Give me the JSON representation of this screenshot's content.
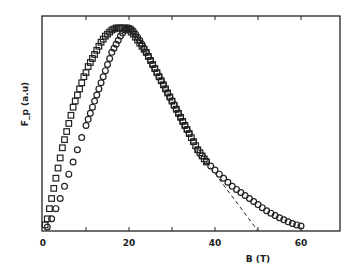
{
  "chart_data": {
    "type": "scatter",
    "title": "",
    "xlabel": "B (T)",
    "ylabel": "F_p (a.u)",
    "xlim": [
      0,
      69
    ],
    "ylim": [
      0,
      1.06
    ],
    "x_ticks": [
      0,
      10,
      20,
      30,
      40,
      50,
      60
    ],
    "x_tick_labels": [
      "0",
      "",
      "20",
      "",
      "40",
      "",
      "60"
    ],
    "y_ticks": [],
    "grid": false,
    "legend": null,
    "series": [
      {
        "name": "squares",
        "marker": "square",
        "x": [
          0.5,
          1,
          1.5,
          2,
          2.5,
          3,
          3.5,
          4,
          4.5,
          5,
          5.5,
          6,
          6.5,
          7,
          7.5,
          8,
          8.5,
          9,
          9.5,
          10,
          10.5,
          11,
          11.5,
          12,
          12.5,
          13,
          13.5,
          14,
          14.5,
          15,
          15.5,
          16,
          16.5,
          17,
          17.5,
          18,
          18.5,
          19,
          19.5,
          20,
          20.5,
          21,
          21.5,
          22,
          22.5,
          23,
          23.5,
          24,
          24.5,
          25,
          25.5,
          26,
          26.5,
          27,
          27.5,
          28,
          28.5,
          29,
          29.5,
          30,
          30.5,
          31,
          31.5,
          32,
          32.5,
          33,
          33.5,
          34,
          34.5,
          35,
          35.5,
          36,
          36.5,
          37,
          37.5,
          38
        ],
        "y": [
          0.03,
          0.06,
          0.11,
          0.16,
          0.21,
          0.26,
          0.31,
          0.36,
          0.41,
          0.45,
          0.49,
          0.53,
          0.57,
          0.61,
          0.64,
          0.67,
          0.7,
          0.73,
          0.76,
          0.78,
          0.81,
          0.83,
          0.85,
          0.87,
          0.89,
          0.91,
          0.93,
          0.945,
          0.96,
          0.97,
          0.98,
          0.99,
          0.995,
          1.0,
          1.0,
          1.0,
          1.0,
          1.0,
          0.995,
          0.99,
          0.98,
          0.97,
          0.955,
          0.94,
          0.925,
          0.91,
          0.895,
          0.88,
          0.86,
          0.84,
          0.82,
          0.8,
          0.78,
          0.76,
          0.74,
          0.72,
          0.7,
          0.68,
          0.66,
          0.64,
          0.62,
          0.6,
          0.58,
          0.56,
          0.54,
          0.52,
          0.5,
          0.48,
          0.46,
          0.44,
          0.42,
          0.4,
          0.385,
          0.37,
          0.355,
          0.34
        ]
      },
      {
        "name": "circles",
        "marker": "circle",
        "x": [
          1,
          2,
          3,
          4,
          5,
          6,
          7,
          8,
          9,
          10,
          10.5,
          11,
          11.5,
          12,
          12.5,
          13,
          13.5,
          14,
          14.5,
          15,
          15.5,
          16,
          16.5,
          17,
          17.5,
          18,
          18.5,
          19,
          19.5,
          20,
          20.5,
          21,
          21.5,
          22,
          22.5,
          23,
          23.5,
          24,
          24.5,
          25,
          25.5,
          26,
          26.5,
          27,
          27.5,
          28,
          28.5,
          29,
          29.5,
          30,
          30.5,
          31,
          31.5,
          32,
          32.5,
          33,
          33.5,
          34,
          35,
          36,
          37,
          38,
          39,
          40,
          41,
          42,
          43,
          44,
          45,
          46,
          47,
          48,
          49,
          50,
          51,
          52,
          53,
          54,
          55,
          56,
          57,
          58,
          59,
          60
        ],
        "y": [
          0.02,
          0.06,
          0.11,
          0.16,
          0.22,
          0.28,
          0.34,
          0.4,
          0.46,
          0.52,
          0.55,
          0.58,
          0.61,
          0.64,
          0.67,
          0.7,
          0.73,
          0.76,
          0.79,
          0.82,
          0.85,
          0.88,
          0.9,
          0.92,
          0.94,
          0.96,
          0.975,
          0.99,
          1.0,
          1.0,
          0.995,
          0.985,
          0.97,
          0.955,
          0.94,
          0.92,
          0.9,
          0.88,
          0.86,
          0.84,
          0.82,
          0.8,
          0.78,
          0.76,
          0.74,
          0.72,
          0.7,
          0.68,
          0.66,
          0.64,
          0.62,
          0.6,
          0.58,
          0.56,
          0.54,
          0.52,
          0.5,
          0.48,
          0.44,
          0.4,
          0.37,
          0.345,
          0.32,
          0.3,
          0.28,
          0.26,
          0.24,
          0.22,
          0.205,
          0.19,
          0.175,
          0.16,
          0.145,
          0.13,
          0.115,
          0.1,
          0.088,
          0.076,
          0.065,
          0.055,
          0.045,
          0.037,
          0.03,
          0.025
        ]
      }
    ],
    "annotations": [
      {
        "type": "dashed-line",
        "description": "linear extrapolation of Fp to zero",
        "x": [
          38,
          50
        ],
        "y": [
          0.34,
          0.0
        ]
      }
    ]
  }
}
